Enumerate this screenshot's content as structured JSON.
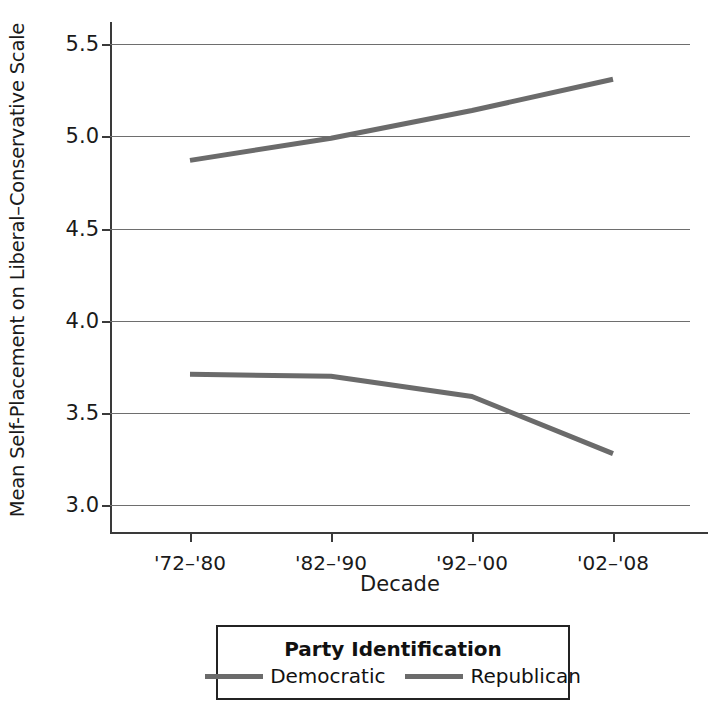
{
  "chart_data": {
    "type": "line",
    "title": "",
    "xlabel": "Decade",
    "ylabel": "Mean Self-Placement on Liberal–Conservative Scale",
    "categories": [
      "'72–'80",
      "'82–'90",
      "'92–'00",
      "'02–'08"
    ],
    "series": [
      {
        "name": "Democratic",
        "values": [
          3.71,
          3.7,
          3.59,
          3.28
        ],
        "color": "#6b6b6b"
      },
      {
        "name": "Republican",
        "values": [
          4.87,
          4.99,
          5.14,
          5.31
        ],
        "color": "#6b6b6b"
      }
    ],
    "ylim": [
      2.85,
      5.62
    ],
    "yticks": [
      3.0,
      3.5,
      4.0,
      4.5,
      5.0,
      5.5
    ],
    "ytick_labels": [
      "3.0",
      "3.5",
      "4.0",
      "4.5",
      "5.0",
      "5.5"
    ],
    "grid": true,
    "legend_position": "below-center",
    "legend_title": "Party Identification"
  },
  "legend": {
    "title": "Party Identification",
    "entries": [
      {
        "label": "Democratic"
      },
      {
        "label": "Republican"
      }
    ]
  },
  "axes": {
    "x_title": "Decade",
    "y_title": "Mean Self-Placement on Liberal–Conservative Scale"
  },
  "colors": {
    "line": "#6b6b6b",
    "grid": "#6e6e6e",
    "axis": "#3a3a3a",
    "text": "#1a1a1a",
    "background": "#ffffff"
  }
}
